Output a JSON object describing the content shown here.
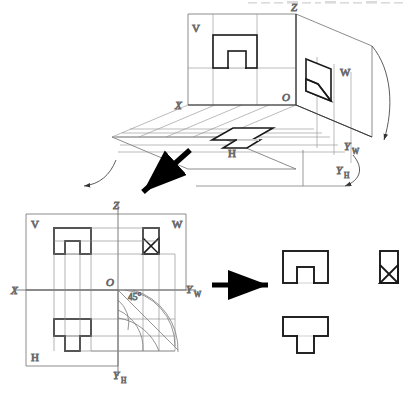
{
  "figure": {
    "title_strip": "",
    "colors": {
      "thin_line": "#6e6e6e",
      "thick_line": "#1a1a1a",
      "arrow": "#000000",
      "background": "#ffffff"
    }
  },
  "pictorial": {
    "name": "three-plane-pictorial",
    "labels": {
      "v_plane": "V",
      "w_plane": "W",
      "h_plane": "H",
      "axis_z": "Z",
      "axis_x": "X",
      "origin": "O",
      "axis_yw": "Y",
      "axis_yw_sub": "W",
      "axis_yh": "Y",
      "axis_yh_sub": "H"
    }
  },
  "unfolded": {
    "name": "unfolded-planes",
    "labels": {
      "v_plane": "V",
      "w_plane": "W",
      "h_plane": "H",
      "axis_z": "Z",
      "axis_x": "X",
      "origin": "O",
      "miter_angle": "45°",
      "axis_yw": "Y",
      "axis_yw_sub": "W",
      "axis_yh": "Y",
      "axis_yh_sub": "H"
    }
  },
  "final_views": {
    "name": "three-view-drawing",
    "views": [
      {
        "id": "front-view",
        "shape": "rectangle-with-bottom-notch"
      },
      {
        "id": "side-view",
        "shape": "rectangle-with-corner-chamfer"
      },
      {
        "id": "top-view",
        "shape": "wide-rectangle-with-tab"
      }
    ]
  },
  "arrows": {
    "diagonal": {
      "name": "unfold-arrow",
      "direction": "down-left"
    },
    "horizontal": {
      "name": "extract-arrow",
      "direction": "right"
    }
  }
}
